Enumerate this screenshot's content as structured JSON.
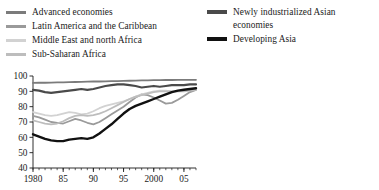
{
  "legend": {
    "left_column": [
      {
        "label": "Advanced economies",
        "color": "#7b7b7b",
        "weight": "normal",
        "swatch_name": "legend-swatch-advanced-economies"
      },
      {
        "label": "Latin America and the Caribbean",
        "color": "#9a9a9a",
        "weight": "normal",
        "swatch_name": "legend-swatch-latin-america"
      },
      {
        "label": "Middle East and north Africa",
        "color": "#d2d2d2",
        "weight": "normal",
        "swatch_name": "legend-swatch-middle-east"
      },
      {
        "label": "Sub-Saharan Africa",
        "color": "#bdbdbd",
        "weight": "normal",
        "swatch_name": "legend-swatch-sub-saharan-africa"
      }
    ],
    "right_column": [
      {
        "label": "Newly industrialized Asian\neconomies",
        "color": "#4a4a4a",
        "weight": "thick",
        "swatch_name": "legend-swatch-newly-industrialized-asian"
      },
      {
        "label": "Developing Asia",
        "color": "#111111",
        "weight": "thick",
        "swatch_name": "legend-swatch-developing-asia"
      }
    ]
  },
  "chart_data": {
    "type": "line",
    "title": "",
    "xlabel": "",
    "ylabel": "",
    "xlim": [
      1980,
      2007
    ],
    "ylim": [
      40,
      100
    ],
    "ytick_values": [
      40,
      50,
      60,
      70,
      80,
      90,
      100
    ],
    "ytick_labels": [
      "40",
      "50",
      "60",
      "70",
      "80",
      "90",
      "100"
    ],
    "xtick_values": [
      1980,
      1985,
      1990,
      1995,
      2000,
      2005
    ],
    "xtick_labels": [
      "1980",
      "85",
      "90",
      "95",
      "2000",
      "05"
    ],
    "minor_xticks": true,
    "grid": false,
    "legend_position": "above-plot",
    "x": [
      1980,
      1981,
      1982,
      1983,
      1984,
      1985,
      1986,
      1987,
      1988,
      1989,
      1990,
      1991,
      1992,
      1993,
      1994,
      1995,
      1996,
      1997,
      1998,
      1999,
      2000,
      2001,
      2002,
      2003,
      2004,
      2005,
      2006,
      2007
    ],
    "series": [
      {
        "name": "Advanced economies",
        "color": "#7b7b7b",
        "width": 1.8,
        "values": [
          95.5,
          95.6,
          95.6,
          95.7,
          95.8,
          95.9,
          96.0,
          96.1,
          96.2,
          96.3,
          96.4,
          96.4,
          96.5,
          96.6,
          96.7,
          96.8,
          96.9,
          97.0,
          97.1,
          97.2,
          97.3,
          97.3,
          97.4,
          97.4,
          97.5,
          97.5,
          97.5,
          97.5
        ]
      },
      {
        "name": "Latin America and the Caribbean",
        "color": "#9a9a9a",
        "width": 1.8,
        "values": [
          74.0,
          73.0,
          71.5,
          70.0,
          69.5,
          69.0,
          70.5,
          72.0,
          71.0,
          69.5,
          68.5,
          70.0,
          72.5,
          75.0,
          77.5,
          80.0,
          83.0,
          86.0,
          88.0,
          87.5,
          86.0,
          84.0,
          82.0,
          82.5,
          84.5,
          87.0,
          89.5,
          91.0
        ]
      },
      {
        "name": "Middle East and north Africa",
        "color": "#d2d2d2",
        "width": 1.8,
        "values": [
          76.5,
          75.5,
          74.5,
          74.0,
          74.5,
          75.5,
          76.5,
          76.0,
          75.0,
          75.5,
          77.0,
          79.0,
          80.5,
          81.5,
          82.5,
          83.5,
          85.0,
          86.5,
          88.0,
          89.0,
          90.0,
          90.5,
          90.5,
          90.0,
          90.0,
          90.5,
          91.0,
          91.5
        ]
      },
      {
        "name": "Sub-Saharan Africa",
        "color": "#bdbdbd",
        "width": 1.8,
        "values": [
          71.0,
          70.0,
          69.0,
          68.5,
          69.0,
          70.5,
          72.5,
          74.0,
          74.5,
          74.0,
          74.5,
          75.5,
          77.0,
          79.0,
          81.0,
          83.0,
          85.0,
          86.5,
          87.5,
          88.5,
          89.5,
          90.0,
          90.0,
          90.0,
          90.0,
          90.0,
          90.5,
          91.0
        ]
      },
      {
        "name": "Newly industrialized Asian economies",
        "color": "#4a4a4a",
        "width": 2.2,
        "values": [
          91.0,
          90.5,
          89.5,
          89.0,
          89.5,
          90.0,
          90.5,
          91.0,
          91.5,
          91.0,
          91.5,
          92.5,
          93.5,
          94.0,
          94.5,
          94.5,
          94.0,
          93.5,
          92.5,
          93.0,
          93.5,
          93.0,
          93.5,
          94.0,
          94.0,
          94.0,
          94.5,
          94.5
        ]
      },
      {
        "name": "Developing Asia",
        "color": "#111111",
        "width": 2.4,
        "values": [
          62.0,
          60.5,
          59.0,
          58.0,
          57.5,
          57.5,
          58.5,
          59.0,
          59.5,
          59.0,
          60.0,
          62.5,
          65.5,
          68.5,
          72.0,
          75.5,
          78.5,
          80.5,
          82.0,
          83.5,
          85.0,
          86.5,
          88.0,
          89.5,
          90.5,
          91.0,
          91.5,
          92.0
        ]
      }
    ]
  }
}
